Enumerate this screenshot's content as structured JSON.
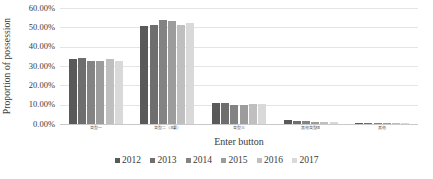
{
  "chart_data": {
    "type": "bar",
    "title": "",
    "xlabel": "Enter button",
    "ylabel": "Proportion of possession",
    "ylim": [
      0,
      0.6
    ],
    "ytick_labels": [
      "60.00%",
      "50.00%",
      "40.00%",
      "30.00%",
      "20.00%",
      "10.00%",
      "0.00%"
    ],
    "ytick_values": [
      0.6,
      0.5,
      0.4,
      0.3,
      0.2,
      0.1,
      0.0
    ],
    "grid": true,
    "legend_position": "bottom",
    "categories": [
      "类型一",
      "类型二（主要）",
      "类型三",
      "其他类型组",
      "其他"
    ],
    "series": [
      {
        "name": "2012",
        "color": "#595959",
        "values": [
          0.338,
          0.508,
          0.11,
          0.021,
          0.005
        ]
      },
      {
        "name": "2013",
        "color": "#6E6E6E",
        "values": [
          0.341,
          0.51,
          0.11,
          0.018,
          0.004
        ]
      },
      {
        "name": "2014",
        "color": "#838383",
        "values": [
          0.324,
          0.539,
          0.098,
          0.018,
          0.004
        ]
      },
      {
        "name": "2015",
        "color": "#9C9C9C",
        "values": [
          0.328,
          0.531,
          0.1,
          0.013,
          0.004
        ]
      },
      {
        "name": "2016",
        "color": "#BFBFBF",
        "values": [
          0.338,
          0.513,
          0.106,
          0.011,
          0.003
        ]
      },
      {
        "name": "2017",
        "color": "#D9D9D9",
        "values": [
          0.328,
          0.524,
          0.105,
          0.008,
          0.002
        ]
      }
    ]
  },
  "legend": {
    "items": [
      {
        "label": "2012"
      },
      {
        "label": "2013"
      },
      {
        "label": "2014"
      },
      {
        "label": "2015"
      },
      {
        "label": "2016"
      },
      {
        "label": "2017"
      }
    ]
  }
}
